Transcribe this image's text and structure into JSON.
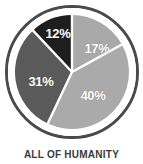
{
  "caption": "ALL OF HUMANITY",
  "background_color": "#ffffff",
  "caption_color": "#3a3a3a",
  "ring": {
    "color": "#4a4a4a",
    "gap_color": "#ffffff"
  },
  "divider": {
    "color": "#ffffff"
  },
  "chart_data": {
    "type": "pie",
    "title": "ALL OF HUMANITY",
    "subtitle": "",
    "xlabel": "",
    "ylabel": "",
    "grid": false,
    "legend": "none",
    "start_angle_deg": 0,
    "direction": "clockwise",
    "units": "percent",
    "total": 100,
    "labels": [
      "17%",
      "40%",
      "31%",
      "12%"
    ],
    "values": [
      17,
      40,
      31,
      12
    ],
    "colors": [
      "#a9a9a9",
      "#aaaaaa",
      "#5a5a5a",
      "#1e1e1e"
    ],
    "slices": [
      {
        "label": "17%",
        "value": 17,
        "color": "#a9a9a9",
        "start_deg": 0,
        "end_deg": 61.2,
        "label_x": 97,
        "label_y": 48
      },
      {
        "label": "40%",
        "value": 40,
        "color": "#aaaaaa",
        "start_deg": 61.2,
        "end_deg": 205.2,
        "label_x": 93,
        "label_y": 95
      },
      {
        "label": "31%",
        "value": 31,
        "color": "#5a5a5a",
        "start_deg": 205.2,
        "end_deg": 316.8,
        "label_x": 41,
        "label_y": 81
      },
      {
        "label": "12%",
        "value": 12,
        "color": "#1e1e1e",
        "start_deg": 316.8,
        "end_deg": 360,
        "label_x": 58,
        "label_y": 33
      }
    ]
  }
}
